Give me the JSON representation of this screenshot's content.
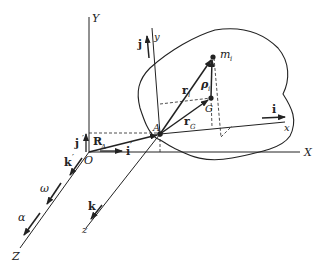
{
  "diagram": {
    "fixed_frame": {
      "origin": "O",
      "axes": {
        "X": "X",
        "Y": "Y",
        "Z": "Z"
      },
      "unit_vectors": {
        "i": "i",
        "j": "j",
        "k": "k"
      },
      "unit_prime": "′"
    },
    "moving_frame": {
      "origin": "A",
      "axes": {
        "x": "x",
        "y": "y",
        "z": "z"
      },
      "unit_vectors": {
        "i": "i",
        "j": "j",
        "k": "k"
      }
    },
    "vectors": {
      "R": "R",
      "R_sub": "A",
      "r_i": "r",
      "r_i_sub": "i",
      "r_G": "r",
      "r_G_sub": "G",
      "rho": "ρ",
      "rho_sub": "i"
    },
    "points": {
      "mass": "m",
      "mass_sub": "i",
      "center": "G"
    },
    "angular": {
      "omega": "ω",
      "alpha": "α"
    },
    "colors": {
      "ink": "#222222",
      "background": "#ffffff"
    }
  }
}
